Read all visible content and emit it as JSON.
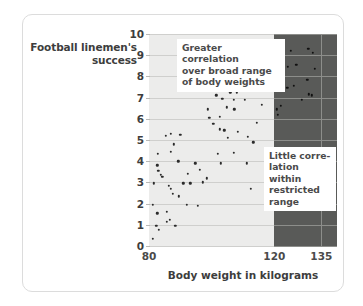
{
  "chart_data": {
    "type": "scatter",
    "title": "",
    "xlabel": "Body weight in kilograms",
    "ylabel": "Football linemen's success",
    "ylabel_line1": "Football linemen's",
    "ylabel_line2": "success",
    "xlim": [
      80,
      140
    ],
    "ylim": [
      0,
      10
    ],
    "xticks": [
      80,
      120,
      135
    ],
    "xtick_labels": [
      "80",
      "120",
      "135"
    ],
    "yticks": [
      0,
      1,
      2,
      3,
      4,
      5,
      6,
      7,
      8,
      9,
      10
    ],
    "ytick_labels": [
      "0",
      "1",
      "2",
      "3",
      "4",
      "5",
      "6",
      "7",
      "8",
      "9",
      "10"
    ],
    "grid": "horizontal",
    "legend": "none",
    "annotations": [
      {
        "id": "broad-range",
        "text": "Greater correlation\nover broad range\nof body weights"
      },
      {
        "id": "restricted-range",
        "text": "Little corre-\nlation within\nrestricted\nrange"
      }
    ],
    "regions": [
      {
        "id": "full-range",
        "x_start": 80,
        "x_end": 120,
        "shade": "#ececeb"
      },
      {
        "id": "restricted-range",
        "x_start": 120,
        "x_end": 140,
        "shade": "#595a58"
      }
    ],
    "colors": {
      "plot_background": "#ececeb",
      "restricted_band": "#595a58",
      "gridline": "#cfcfcd",
      "gridline_dark": "#8d8e8b",
      "point": "#2b2b2b",
      "text": "#3d3d3d",
      "card_border": "#dcdcdc"
    },
    "points": [
      {
        "x": 81.3,
        "y": 0.35
      },
      {
        "x": 82.3,
        "y": 0.95
      },
      {
        "x": 83.1,
        "y": 0.75
      },
      {
        "x": 85.6,
        "y": 1.15
      },
      {
        "x": 86.6,
        "y": 1.25
      },
      {
        "x": 88.4,
        "y": 0.95
      },
      {
        "x": 82.6,
        "y": 1.55
      },
      {
        "x": 85.6,
        "y": 1.6
      },
      {
        "x": 81.2,
        "y": 1.95
      },
      {
        "x": 92.0,
        "y": 1.95
      },
      {
        "x": 95.5,
        "y": 1.9
      },
      {
        "x": 89.5,
        "y": 2.35
      },
      {
        "x": 87.6,
        "y": 2.45
      },
      {
        "x": 87.0,
        "y": 2.7
      },
      {
        "x": 86.4,
        "y": 2.85
      },
      {
        "x": 81.5,
        "y": 2.95
      },
      {
        "x": 90.9,
        "y": 2.95
      },
      {
        "x": 93.2,
        "y": 2.95
      },
      {
        "x": 97.2,
        "y": 3.0
      },
      {
        "x": 112.5,
        "y": 2.7
      },
      {
        "x": 83.7,
        "y": 3.35
      },
      {
        "x": 84.3,
        "y": 3.25
      },
      {
        "x": 92.3,
        "y": 3.4
      },
      {
        "x": 98.5,
        "y": 3.2
      },
      {
        "x": 83.0,
        "y": 3.55
      },
      {
        "x": 96.3,
        "y": 3.6
      },
      {
        "x": 82.6,
        "y": 3.8
      },
      {
        "x": 94.8,
        "y": 3.9
      },
      {
        "x": 103.0,
        "y": 3.9
      },
      {
        "x": 111.2,
        "y": 3.9
      },
      {
        "x": 89.3,
        "y": 4.0
      },
      {
        "x": 82.9,
        "y": 4.35
      },
      {
        "x": 87.0,
        "y": 4.45
      },
      {
        "x": 102.0,
        "y": 4.35
      },
      {
        "x": 107.0,
        "y": 4.4
      },
      {
        "x": 88.0,
        "y": 4.8
      },
      {
        "x": 113.3,
        "y": 4.9
      },
      {
        "x": 85.3,
        "y": 5.2
      },
      {
        "x": 86.9,
        "y": 5.3
      },
      {
        "x": 90.0,
        "y": 5.25
      },
      {
        "x": 105.2,
        "y": 5.1
      },
      {
        "x": 111.5,
        "y": 5.15
      },
      {
        "x": 102.6,
        "y": 5.5
      },
      {
        "x": 104.0,
        "y": 5.45
      },
      {
        "x": 108.3,
        "y": 5.4
      },
      {
        "x": 100.5,
        "y": 5.75
      },
      {
        "x": 114.5,
        "y": 5.8
      },
      {
        "x": 99.3,
        "y": 6.05
      },
      {
        "x": 102.5,
        "y": 6.1
      },
      {
        "x": 104.8,
        "y": 6.55
      },
      {
        "x": 98.8,
        "y": 6.45
      },
      {
        "x": 107.2,
        "y": 6.45
      },
      {
        "x": 116.0,
        "y": 6.65
      },
      {
        "x": 103.4,
        "y": 6.95
      },
      {
        "x": 107.0,
        "y": 6.9
      },
      {
        "x": 110.5,
        "y": 6.9
      },
      {
        "x": 101.5,
        "y": 7.1
      },
      {
        "x": 106.0,
        "y": 7.25
      },
      {
        "x": 108.0,
        "y": 7.25
      },
      {
        "x": 110.0,
        "y": 7.55
      },
      {
        "x": 109.0,
        "y": 7.8
      },
      {
        "x": 112.5,
        "y": 8.0
      },
      {
        "x": 116.5,
        "y": 8.1
      },
      {
        "x": 121.2,
        "y": 6.2
      },
      {
        "x": 120.8,
        "y": 6.45
      },
      {
        "x": 122.0,
        "y": 6.6
      },
      {
        "x": 120.4,
        "y": 7.75
      },
      {
        "x": 124.2,
        "y": 7.45
      },
      {
        "x": 126.3,
        "y": 7.55
      },
      {
        "x": 128.8,
        "y": 6.9
      },
      {
        "x": 131.0,
        "y": 7.15
      },
      {
        "x": 132.0,
        "y": 7.1
      },
      {
        "x": 130.5,
        "y": 7.85
      },
      {
        "x": 121.0,
        "y": 8.95
      },
      {
        "x": 123.0,
        "y": 8.95
      },
      {
        "x": 124.3,
        "y": 8.45
      },
      {
        "x": 127.0,
        "y": 8.55
      },
      {
        "x": 133.0,
        "y": 8.35
      },
      {
        "x": 125.2,
        "y": 9.2
      },
      {
        "x": 130.8,
        "y": 9.3
      },
      {
        "x": 132.2,
        "y": 9.1
      }
    ]
  },
  "y_axis": {
    "title_line1": "Football linemen's",
    "title_line2": "success"
  },
  "x_axis": {
    "title": "Body weight in kilograms"
  },
  "callouts": {
    "broad_range": "Greater correlation\nover broad range\nof body weights",
    "restricted_range": "Little corre-\nlation within\nrestricted\nrange"
  }
}
